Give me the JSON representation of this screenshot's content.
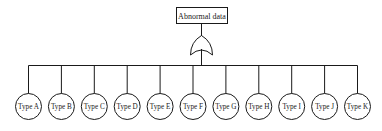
{
  "diagram": {
    "type": "fault-tree",
    "top_event": {
      "label": "Abnormal data"
    },
    "gate": {
      "type": "OR",
      "icon": "or-gate-icon"
    },
    "basic_events": [
      {
        "label": "Type A"
      },
      {
        "label": "Type B"
      },
      {
        "label": "Type C"
      },
      {
        "label": "Type D"
      },
      {
        "label": "Type E"
      },
      {
        "label": "Type F"
      },
      {
        "label": "Type G"
      },
      {
        "label": "Type H"
      },
      {
        "label": "Type I"
      },
      {
        "label": "Type J"
      },
      {
        "label": "Type K"
      }
    ],
    "colors": {
      "stroke": "#1a1a1a",
      "background": "#ffffff"
    }
  }
}
